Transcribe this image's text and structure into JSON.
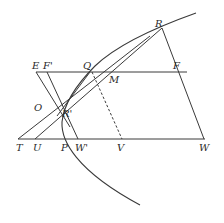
{
  "figure": {
    "type": "geometric construction",
    "points": {
      "R": "R",
      "E": "E",
      "F_prime": "F'",
      "Q": "Q",
      "M": "M",
      "F": "F",
      "O": "O",
      "R_prime": "R'",
      "T": "T",
      "U": "U",
      "P": "P",
      "W_prime": "W'",
      "V": "V",
      "W": "W"
    },
    "colors": {
      "line": "#3a3a3a",
      "label": "#2a2a2a",
      "background": "#ffffff"
    }
  }
}
